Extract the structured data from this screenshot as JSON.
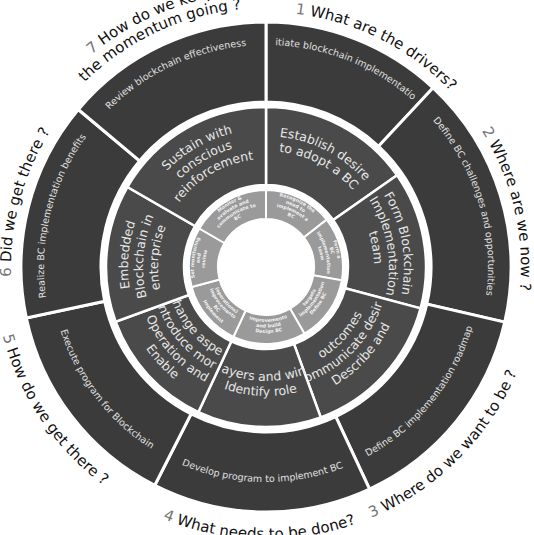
{
  "diagram": {
    "colors": {
      "outer_ring": "#3b3b3b",
      "middle_ring": "#4a4a4a",
      "inner_ring": "#9a9a9a",
      "divider": "#ffffff",
      "question_text": "#111111",
      "question_number": "#777777"
    },
    "questions": [
      {
        "number": "1",
        "text": "What are the drivers?"
      },
      {
        "number": "2",
        "text": "Where are we now ?"
      },
      {
        "number": "3",
        "text": "Where do we want to be ?"
      },
      {
        "number": "4",
        "text": "What needs to be done?"
      },
      {
        "number": "5",
        "text": "How do we get there ?"
      },
      {
        "number": "6",
        "text": "Did we get there ?"
      },
      {
        "number": "7",
        "text": "How do we keep the momentum going ?",
        "line1": "How do we keep",
        "line2": "the momentum going ?"
      }
    ],
    "outer_ring": [
      "Initiate blockchain implementation",
      "Define BC challenges and opportunities",
      "Define BC implementation roadmap",
      "Develop program to implement BC",
      "Execute program for Blockchain",
      "Realize BC implementation benefits",
      "Review blockchain effectiveness"
    ],
    "middle_ring": [
      {
        "lines": [
          "Establish desire",
          "to adopt a BC"
        ]
      },
      {
        "lines": [
          "Form Blockchain",
          "Implementation",
          "team"
        ]
      },
      {
        "lines": [
          "Describe and",
          "Communicate desired",
          "outcomes"
        ]
      },
      {
        "lines": [
          "Identify role",
          "players and wins"
        ]
      },
      {
        "lines": [
          "Enable",
          "Operation and",
          "introduce more",
          "Change aspect"
        ]
      },
      {
        "lines": [
          "Embedded",
          "Blockchain in",
          "enterprise"
        ]
      },
      {
        "lines": [
          "Sustain with",
          "conscious",
          "reinforcement"
        ]
      }
    ],
    "inner_ring": [
      {
        "lines": [
          "Recognize the",
          "need to",
          "implement a",
          "BC"
        ]
      },
      {
        "lines": [
          "Form a",
          "BC",
          "implementation",
          "team"
        ]
      },
      {
        "lines": [
          "Define BC",
          "implementation",
          "targets"
        ]
      },
      {
        "lines": [
          "Design BC",
          "and build",
          "improvements"
        ]
      },
      {
        "lines": [
          "Implement",
          "BC",
          "improvements",
          "(operations)"
        ]
      },
      {
        "lines": [
          "Set monitoring",
          "and",
          "review"
        ]
      },
      {
        "lines": [
          "Monitor &",
          "evaluate and",
          "communicate to",
          "BC"
        ]
      }
    ]
  }
}
